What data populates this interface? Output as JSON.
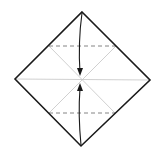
{
  "diagram": {
    "type": "origami-fold-diagram",
    "shape": "square-diamond",
    "colors": {
      "outline": "#1a1a1a",
      "crease": "#bdbdbd",
      "dashed": "#555555",
      "arrow": "#1a1a1a",
      "background": "#ffffff"
    },
    "vertices": {
      "top": [
        82,
        12
      ],
      "right": [
        150,
        80
      ],
      "bottom": [
        81,
        146
      ],
      "left": [
        15,
        79
      ],
      "center": [
        81,
        80
      ]
    },
    "fold_lines": [
      {
        "kind": "valley-dashed",
        "from": [
          49,
          46
        ],
        "to": [
          116,
          46
        ]
      },
      {
        "kind": "valley-dashed",
        "from": [
          49,
          113
        ],
        "to": [
          115,
          113
        ]
      }
    ],
    "arrows": [
      {
        "from": "top",
        "to": "center",
        "direction": "down"
      },
      {
        "from": "bottom",
        "to": "center",
        "direction": "up"
      }
    ]
  }
}
